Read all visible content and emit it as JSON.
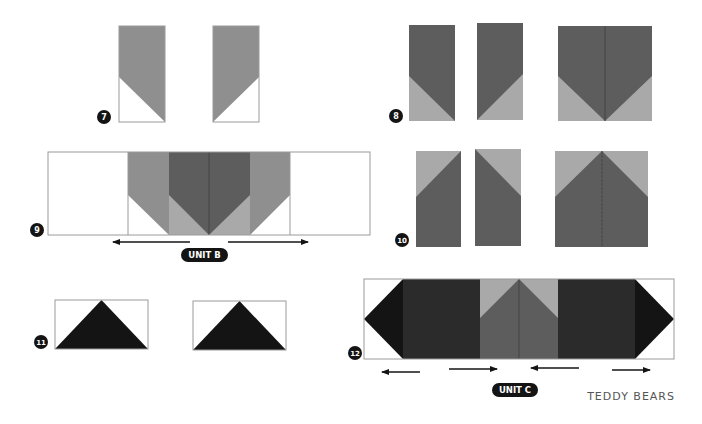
{
  "colors": {
    "white": "#ffffff",
    "outline": "#9a9a9a",
    "mid_gray": "#8f8f8f",
    "dark_gray": "#5d5d5d",
    "light_gray": "#a9a9a9",
    "charcoal": "#2b2b2b",
    "black": "#141414",
    "badge": "#141414",
    "seam": "#444444"
  },
  "steps": [
    {
      "id": "7",
      "label": "7"
    },
    {
      "id": "8",
      "label": "8"
    },
    {
      "id": "9",
      "label": "9"
    },
    {
      "id": "10",
      "label": "10"
    },
    {
      "id": "11",
      "label": "11"
    },
    {
      "id": "12",
      "label": "12"
    }
  ],
  "units": {
    "unit_b": "UNIT B",
    "unit_c": "UNIT C"
  },
  "pattern_name": "TEDDY BEARS",
  "pressing_arrows": {
    "unit_b": [
      "left",
      "right"
    ],
    "unit_c": [
      "left",
      "right",
      "left",
      "right"
    ]
  }
}
